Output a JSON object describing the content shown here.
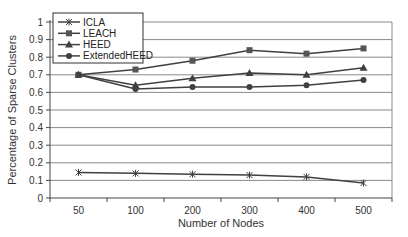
{
  "chart_data": {
    "type": "line",
    "title": "",
    "xlabel": "Number of Nodes",
    "ylabel": "Percentage of Sparse Clusters",
    "categories": [
      "50",
      "100",
      "200",
      "300",
      "400",
      "500"
    ],
    "ylim": [
      0,
      1
    ],
    "yticks": [
      "0",
      "0.1",
      "0.2",
      "0.3",
      "0.4",
      "0.5",
      "0.6",
      "0.7",
      "0.8",
      "0.9",
      "1"
    ],
    "grid": true,
    "legend_position": "top-left inside",
    "series": [
      {
        "name": "ICLA",
        "marker": "asterisk",
        "values": [
          0.145,
          0.14,
          0.135,
          0.13,
          0.12,
          0.085
        ]
      },
      {
        "name": "LEACH",
        "marker": "square",
        "values": [
          0.7,
          0.73,
          0.78,
          0.84,
          0.82,
          0.85
        ]
      },
      {
        "name": "HEED",
        "marker": "triangle",
        "values": [
          0.7,
          0.64,
          0.68,
          0.71,
          0.7,
          0.74
        ]
      },
      {
        "name": "ExtendedHEED",
        "marker": "circle",
        "values": [
          0.7,
          0.62,
          0.63,
          0.63,
          0.64,
          0.67
        ]
      }
    ]
  },
  "colors": {
    "line": "#404040",
    "grid": "#8a8a8a",
    "axis": "#444444"
  }
}
